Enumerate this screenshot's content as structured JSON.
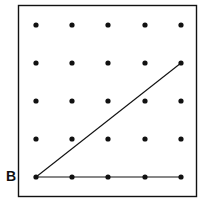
{
  "diagram": {
    "type": "geoboard",
    "grid": {
      "rows": 5,
      "cols": 5
    },
    "label_point": {
      "text": "B",
      "row": 4,
      "col": 0
    },
    "segments": [
      {
        "from": {
          "row": 4,
          "col": 0
        },
        "to": {
          "row": 1,
          "col": 4
        }
      },
      {
        "from": {
          "row": 4,
          "col": 0
        },
        "to": {
          "row": 4,
          "col": 4
        }
      }
    ],
    "colors": {
      "ink": "#111111",
      "background": "#ffffff"
    }
  }
}
